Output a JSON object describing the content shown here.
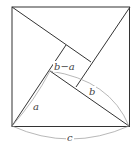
{
  "diagram": {
    "colors": {
      "line": "#333333",
      "arc": "#999999",
      "text": "#444444",
      "background": "#ffffff"
    },
    "outer_square": {
      "tl": [
        12,
        7
      ],
      "tr": [
        130,
        7
      ],
      "br": [
        129,
        126
      ],
      "bl": [
        12,
        126
      ]
    },
    "inner_square": {
      "p1": [
        66,
        45
      ],
      "p2": [
        91,
        62
      ],
      "p3": [
        76,
        87
      ],
      "p4": [
        50,
        71
      ]
    },
    "labels": {
      "inner": "b−a",
      "a": "a",
      "b": "b",
      "c": "c"
    }
  }
}
